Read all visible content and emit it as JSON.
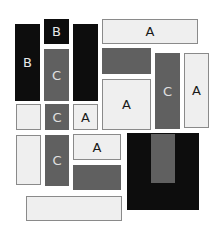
{
  "blocks": [
    {
      "id": "b1",
      "label": "B",
      "style": "black",
      "x": 15,
      "y": 24,
      "w": 25,
      "h": 77
    },
    {
      "id": "b2",
      "label": "B",
      "style": "black",
      "x": 44,
      "y": 19,
      "w": 25,
      "h": 25
    },
    {
      "id": "c1",
      "label": "C",
      "style": "gray",
      "x": 44,
      "y": 49,
      "w": 25,
      "h": 52
    },
    {
      "id": "k1",
      "label": "",
      "style": "black",
      "x": 73,
      "y": 24,
      "w": 25,
      "h": 77
    },
    {
      "id": "a1",
      "label": "A",
      "style": "light",
      "x": 102,
      "y": 19,
      "w": 96,
      "h": 25
    },
    {
      "id": "g1",
      "label": "",
      "style": "gray",
      "x": 102,
      "y": 48,
      "w": 49,
      "h": 26
    },
    {
      "id": "a2",
      "label": "A",
      "style": "light",
      "x": 102,
      "y": 79,
      "w": 49,
      "h": 51
    },
    {
      "id": "c2",
      "label": "C",
      "style": "gray",
      "x": 155,
      "y": 53,
      "w": 25,
      "h": 76
    },
    {
      "id": "a3",
      "label": "A",
      "style": "light",
      "x": 184,
      "y": 53,
      "w": 25,
      "h": 75
    },
    {
      "id": "l1",
      "label": "",
      "style": "light",
      "x": 16,
      "y": 104,
      "w": 25,
      "h": 26
    },
    {
      "id": "c3",
      "label": "C",
      "style": "gray",
      "x": 45,
      "y": 104,
      "w": 24,
      "h": 26
    },
    {
      "id": "a4",
      "label": "A",
      "style": "light",
      "x": 73,
      "y": 104,
      "w": 25,
      "h": 26
    },
    {
      "id": "l2",
      "label": "",
      "style": "light",
      "x": 16,
      "y": 135,
      "w": 25,
      "h": 50
    },
    {
      "id": "c4",
      "label": "C",
      "style": "gray",
      "x": 45,
      "y": 135,
      "w": 24,
      "h": 51
    },
    {
      "id": "a5",
      "label": "A",
      "style": "light",
      "x": 73,
      "y": 134,
      "w": 48,
      "h": 26
    },
    {
      "id": "g2",
      "label": "",
      "style": "gray",
      "x": 73,
      "y": 165,
      "w": 48,
      "h": 25
    },
    {
      "id": "l3",
      "label": "",
      "style": "light",
      "x": 26,
      "y": 196,
      "w": 96,
      "h": 25
    },
    {
      "id": "k2",
      "label": "",
      "style": "black",
      "x": 127,
      "y": 133,
      "w": 72,
      "h": 77
    },
    {
      "id": "g3",
      "label": "",
      "style": "gray",
      "x": 151,
      "y": 134,
      "w": 24,
      "h": 49
    }
  ]
}
